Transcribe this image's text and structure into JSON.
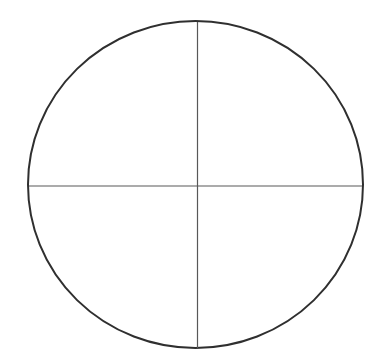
{
  "figure": {
    "title": "Circle divided into four quadrants by two perpendicular diameters",
    "background_color": "#ffffff",
    "canvas": {
      "width": 388,
      "height": 356
    },
    "circle": {
      "label": "circle-outline",
      "center_x": 195.5,
      "center_y": 184.5,
      "radius_x": 167.5,
      "radius_y": 163.5,
      "left_edge_x": 28,
      "right_edge_x": 363,
      "top_edge_y": 21,
      "bottom_edge_y": 348,
      "stroke_color": "#2f2f2f",
      "stroke_width": 2.0
    },
    "vertical_diameter": {
      "label": "vertical-diameter",
      "x": 197.5,
      "y_start": 22,
      "y_end": 348,
      "stroke_color": "#585858",
      "stroke_width": 1.2
    },
    "horizontal_diameter": {
      "label": "horizontal-diameter",
      "y": 186.0,
      "x_start": 29,
      "x_end": 362,
      "stroke_color": "#585858",
      "stroke_width": 1.2
    },
    "intersection": {
      "label": "center-intersection",
      "x": 197.5,
      "y": 186.0
    }
  }
}
